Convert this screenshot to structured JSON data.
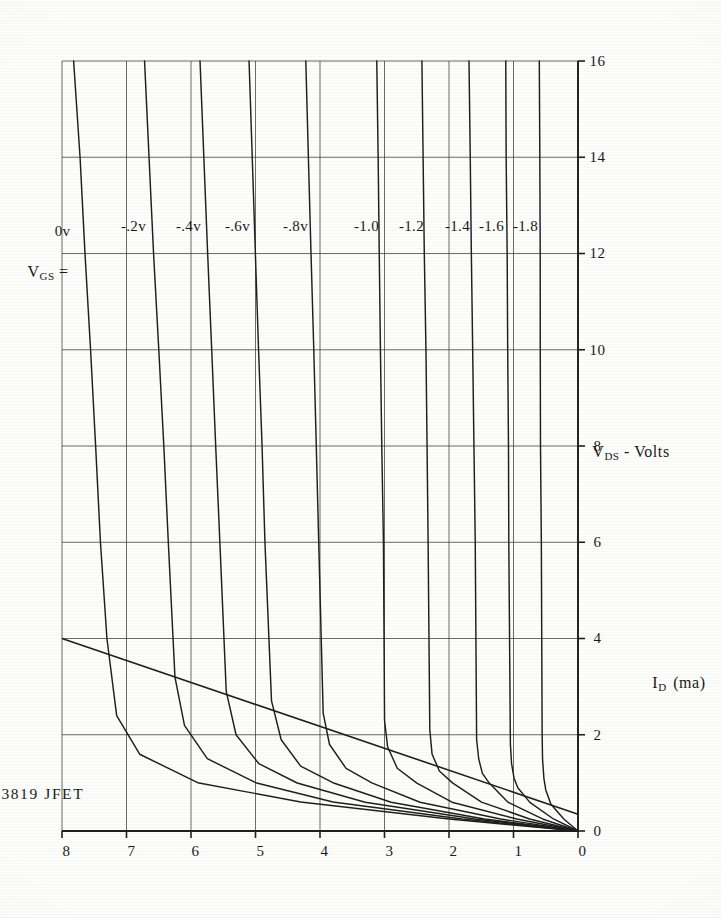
{
  "page": {
    "device": "2N3819",
    "device_type": "JFET",
    "header_text": "2N3819   JFET"
  },
  "family_label": {
    "symbol": "V",
    "subscript": "GS",
    "equals": "=",
    "full": "V_GS ="
  },
  "axes": {
    "x_title_symbol": "V",
    "x_title_sub": "DS",
    "x_title_tail": "- Volts",
    "x_title_full": "V_DS - Volts",
    "y_title_symbol": "I",
    "y_title_sub": "D",
    "y_title_unit": "(ma)",
    "y_title_full": "I_D (ma)"
  },
  "chart_data": {
    "type": "line",
    "title": "2N3819   JFET",
    "xlabel": "V_DS - Volts",
    "ylabel": "I_D (ma)",
    "xlim": [
      0,
      16
    ],
    "ylim": [
      0,
      8
    ],
    "xticks": [
      0,
      2,
      4,
      6,
      8,
      10,
      12,
      14,
      16
    ],
    "yticks": [
      0,
      1,
      2,
      3,
      4,
      5,
      6,
      7,
      8
    ],
    "xtick_labels": [
      "0",
      "2",
      "4",
      "6",
      "8",
      "10",
      "12",
      "14",
      "16"
    ],
    "ytick_labels": [
      "0",
      "1",
      "2",
      "3",
      "4",
      "5",
      "6",
      "7",
      "8"
    ],
    "grid": true,
    "grid_spacing_x": 2,
    "grid_spacing_y": 1,
    "legend_position": "in-plot-curve-labels",
    "legend_title": "V_GS =",
    "series": [
      {
        "name": "0v",
        "label": "0v",
        "vgs": 0.0,
        "x": [
          0,
          0.25,
          0.6,
          1.0,
          1.6,
          2.4,
          4,
          6,
          8,
          10,
          12,
          14,
          16
        ],
        "values": [
          0,
          2.0,
          4.3,
          5.9,
          6.8,
          7.15,
          7.3,
          7.4,
          7.48,
          7.56,
          7.64,
          7.72,
          7.82
        ]
      },
      {
        "name": "-.2v",
        "label": "-.2v",
        "vgs": -0.2,
        "x": [
          0,
          0.25,
          0.6,
          1.0,
          1.5,
          2.2,
          3.2,
          6,
          8,
          10,
          12,
          14,
          16
        ],
        "values": [
          0,
          1.8,
          3.8,
          5.0,
          5.75,
          6.1,
          6.25,
          6.35,
          6.42,
          6.5,
          6.58,
          6.65,
          6.72
        ]
      },
      {
        "name": "-.4v",
        "label": "-.4v",
        "vgs": -0.4,
        "x": [
          0,
          0.25,
          0.6,
          1.0,
          1.4,
          2.0,
          2.9,
          6,
          8,
          10,
          12,
          14,
          16
        ],
        "values": [
          0,
          1.6,
          3.3,
          4.35,
          4.95,
          5.3,
          5.45,
          5.55,
          5.62,
          5.68,
          5.74,
          5.8,
          5.86
        ]
      },
      {
        "name": "-.6v",
        "label": "-.6v",
        "vgs": -0.6,
        "x": [
          0,
          0.25,
          0.6,
          1.0,
          1.35,
          1.9,
          2.7,
          6,
          8,
          10,
          12,
          14,
          16
        ],
        "values": [
          0,
          1.45,
          2.9,
          3.8,
          4.3,
          4.6,
          4.75,
          4.85,
          4.9,
          4.95,
          5.0,
          5.05,
          5.1
        ]
      },
      {
        "name": "-.8v",
        "label": "-.8v",
        "vgs": -0.8,
        "x": [
          0,
          0.25,
          0.6,
          1.0,
          1.3,
          1.8,
          2.45,
          6,
          8,
          10,
          12,
          14,
          16
        ],
        "values": [
          0,
          1.2,
          2.45,
          3.2,
          3.6,
          3.85,
          3.95,
          4.02,
          4.06,
          4.1,
          4.14,
          4.18,
          4.22
        ]
      },
      {
        "name": "-1.0",
        "label": "-1.0",
        "vgs": -1.0,
        "x": [
          0,
          0.25,
          0.6,
          1.0,
          1.3,
          1.75,
          2.3,
          6,
          8,
          10,
          12,
          14,
          16
        ],
        "values": [
          0,
          0.95,
          1.95,
          2.5,
          2.8,
          2.95,
          3.0,
          3.02,
          3.04,
          3.06,
          3.08,
          3.1,
          3.12
        ]
      },
      {
        "name": "-1.2",
        "label": "-1.2",
        "vgs": -1.2,
        "x": [
          0,
          0.25,
          0.6,
          1.0,
          1.25,
          1.6,
          2.1,
          6,
          8,
          10,
          12,
          14,
          16
        ],
        "values": [
          0,
          0.75,
          1.5,
          1.95,
          2.15,
          2.26,
          2.3,
          2.32,
          2.34,
          2.36,
          2.38,
          2.4,
          2.42
        ]
      },
      {
        "name": "-1.4",
        "label": "-1.4",
        "vgs": -1.4,
        "x": [
          0,
          0.25,
          0.6,
          1.0,
          1.2,
          1.5,
          1.9,
          6,
          8,
          10,
          12,
          14,
          16
        ],
        "values": [
          0,
          0.55,
          1.08,
          1.38,
          1.48,
          1.54,
          1.57,
          1.59,
          1.61,
          1.63,
          1.65,
          1.67,
          1.69
        ]
      },
      {
        "name": "-1.6",
        "label": "-1.6",
        "vgs": -1.6,
        "x": [
          0,
          0.25,
          0.6,
          0.9,
          1.1,
          1.4,
          1.8,
          6,
          8,
          10,
          12,
          14,
          16
        ],
        "values": [
          0,
          0.38,
          0.75,
          0.93,
          0.99,
          1.03,
          1.05,
          1.07,
          1.08,
          1.09,
          1.1,
          1.11,
          1.12
        ]
      },
      {
        "name": "-1.8",
        "label": "-1.8",
        "vgs": -1.8,
        "x": [
          0,
          0.25,
          0.55,
          0.85,
          1.1,
          1.5,
          2.0,
          6,
          8,
          10,
          12,
          14,
          16
        ],
        "values": [
          0,
          0.22,
          0.42,
          0.5,
          0.53,
          0.55,
          0.56,
          0.57,
          0.58,
          0.585,
          0.59,
          0.595,
          0.6
        ]
      }
    ],
    "load_line": {
      "name": "load-line",
      "x": [
        0.35,
        4.0
      ],
      "values": [
        0.0,
        8.0
      ],
      "description": "dc load line from (VDS=0.35, ID=0) to (VDS=4, ID=8)"
    },
    "annotations": [
      {
        "text": "V_GS =",
        "x": 12.1,
        "y": 7.95
      },
      {
        "text": "0v",
        "x": 12.6,
        "y": 7.7
      },
      {
        "text": "-.2v",
        "x": 12.6,
        "y": 6.6
      },
      {
        "text": "-.4v",
        "x": 12.6,
        "y": 5.75
      },
      {
        "text": "-.6v",
        "x": 12.6,
        "y": 5.0
      },
      {
        "text": "-.8v",
        "x": 12.6,
        "y": 4.1
      },
      {
        "text": "-1.0",
        "x": 12.6,
        "y": 3.0
      },
      {
        "text": "-1.2",
        "x": 12.6,
        "y": 2.3
      },
      {
        "text": "-1.4",
        "x": 12.6,
        "y": 1.58
      },
      {
        "text": "-1.6",
        "x": 12.6,
        "y": 1.05
      },
      {
        "text": "-1.8",
        "x": 12.6,
        "y": 0.52
      }
    ]
  },
  "style": {
    "ink": "#1f1f1f",
    "grid_ink": "#333333",
    "paper": "#fdfdfb"
  }
}
